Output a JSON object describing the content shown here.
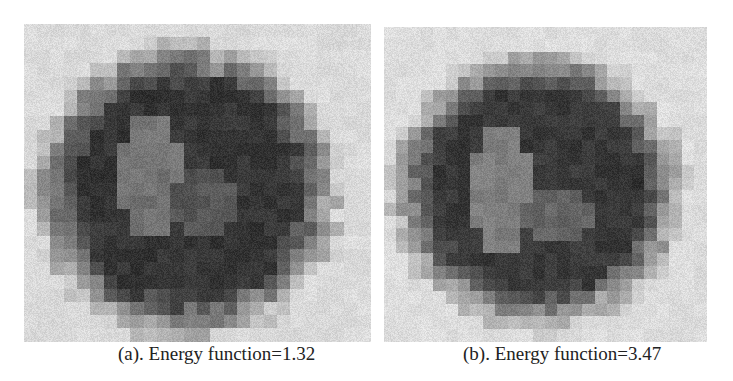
{
  "figure": {
    "panels": [
      {
        "id": "a",
        "caption": "(a). Energy function=1.32",
        "label": "(a)",
        "energy_function": 1.32,
        "grid": {
          "cols": 26,
          "rows": 24,
          "background_gray": 218,
          "center": [
            12.2,
            12.6
          ],
          "radius_x": 10.4,
          "radius_y": 10.2,
          "dark_gray": 45,
          "inner_light": [
            {
              "cx": 9.5,
              "cy": 11.5,
              "rx": 2.2,
              "ry": 5.0,
              "gray": 115
            },
            {
              "cx": 13.5,
              "cy": 13.5,
              "rx": 2.2,
              "ry": 2.6,
              "gray": 85
            }
          ],
          "top_spike": [
            14,
            3
          ]
        }
      },
      {
        "id": "b",
        "caption": "(b). Energy function=3.47",
        "label": "(b)",
        "energy_function": 3.47,
        "grid": {
          "cols": 26,
          "rows": 25,
          "background_gray": 220,
          "center": [
            12.4,
            13.0
          ],
          "radius_x": 10.6,
          "radius_y": 10.0,
          "dark_gray": 48,
          "inner_light": [
            {
              "cx": 9.5,
              "cy": 13.0,
              "rx": 2.4,
              "ry": 5.0,
              "gray": 125
            },
            {
              "cx": 14.0,
              "cy": 15.0,
              "rx": 3.0,
              "ry": 2.2,
              "gray": 100
            }
          ],
          "top_spike": null
        }
      }
    ]
  }
}
